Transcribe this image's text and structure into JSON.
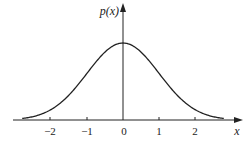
{
  "chart_data": {
    "type": "line",
    "title": "",
    "xlabel": "x",
    "ylabel": "p(x)",
    "xlim": [
      -2.8,
      2.8
    ],
    "xticks": [
      -2,
      -1,
      0,
      1,
      2
    ],
    "xtick_labels": [
      "−2",
      "−1",
      "0",
      "1",
      "2"
    ],
    "grid": false,
    "legend": null,
    "series": [
      {
        "name": "p(x)",
        "description": "bell-shaped (Gaussian) probability density, peak at x=0",
        "x": [
          -2.8,
          -2.5,
          -2,
          -1.5,
          -1,
          -0.5,
          0,
          0.5,
          1,
          1.5,
          2,
          2.5,
          2.8
        ],
        "y": [
          0.008,
          0.018,
          0.054,
          0.13,
          0.242,
          0.352,
          0.399,
          0.352,
          0.242,
          0.13,
          0.054,
          0.018,
          0.008
        ]
      }
    ]
  },
  "labels": {
    "y_axis": "p(x)",
    "x_axis": "x",
    "ticks": [
      "−2",
      "−1",
      "0",
      "1",
      "2"
    ]
  }
}
